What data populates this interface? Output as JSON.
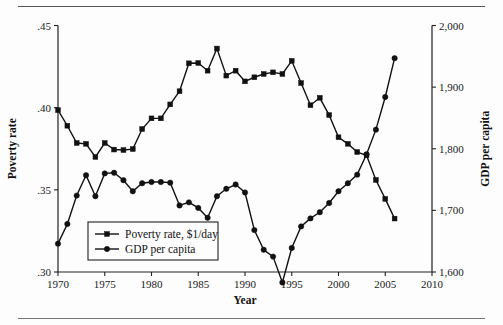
{
  "figure": {
    "background": "#fdfdfd",
    "ink": "#111111"
  },
  "chart_data": {
    "type": "line",
    "title": "",
    "xlabel": "Year",
    "ylabel": "Poverty rate",
    "y2label": "GDP per capita",
    "grid": false,
    "legend_position": "bottom-left",
    "xlim": [
      1970,
      2010
    ],
    "xticks": [
      1970,
      1975,
      1980,
      1985,
      1990,
      1995,
      2000,
      2005,
      2010
    ],
    "xticklabels": [
      "1970",
      "1975",
      "1980",
      "1985",
      "1990",
      "1995",
      "2000",
      "2005",
      "2010"
    ],
    "ylim": [
      0.3,
      0.45
    ],
    "yticks": [
      0.3,
      0.35,
      0.4,
      0.45
    ],
    "yticklabels": [
      ".30",
      ".35",
      ".40",
      ".45"
    ],
    "y2lim": [
      1600,
      2000
    ],
    "y2ticks": [
      1600,
      1700,
      1800,
      1900,
      2000
    ],
    "y2ticklabels": [
      "1,600",
      "1,700",
      "1,800",
      "1,900",
      "2,000"
    ],
    "x": [
      1970,
      1971,
      1972,
      1973,
      1974,
      1975,
      1976,
      1977,
      1978,
      1979,
      1980,
      1981,
      1982,
      1983,
      1984,
      1985,
      1986,
      1987,
      1988,
      1989,
      1990,
      1991,
      1992,
      1993,
      1994,
      1995,
      1996,
      1997,
      1998,
      1999,
      2000,
      2001,
      2002,
      2003,
      2004,
      2005,
      2006
    ],
    "series": [
      {
        "name": "Poverty rate, $1/day",
        "axis": "left",
        "marker": "square",
        "values": [
          0.3985,
          0.389,
          0.3785,
          0.378,
          0.37,
          0.3785,
          0.3745,
          0.3742,
          0.3748,
          0.387,
          0.3935,
          0.3935,
          0.402,
          0.41,
          0.427,
          0.4272,
          0.4225,
          0.436,
          0.4195,
          0.4225,
          0.416,
          0.4185,
          0.4205,
          0.4215,
          0.4205,
          0.4285,
          0.415,
          0.4015,
          0.406,
          0.3955,
          0.382,
          0.378,
          0.373,
          0.371,
          0.356,
          0.3445,
          0.3325
        ]
      },
      {
        "name": "GDP per capita",
        "axis": "right",
        "marker": "circle",
        "values": [
          1646,
          1678,
          1724,
          1757,
          1723,
          1760,
          1761,
          1749,
          1731,
          1744,
          1746,
          1746,
          1745,
          1708,
          1713,
          1704,
          1688,
          1723,
          1735,
          1742,
          1729,
          1668,
          1636,
          1625,
          1583,
          1639,
          1674,
          1687,
          1697,
          1712,
          1731,
          1744,
          1758,
          1791,
          1831,
          1884,
          1947
        ]
      }
    ]
  },
  "legend": {
    "items": [
      {
        "label": "Poverty rate, $1/day",
        "marker": "square"
      },
      {
        "label": "GDP per capita",
        "marker": "circle"
      }
    ]
  }
}
